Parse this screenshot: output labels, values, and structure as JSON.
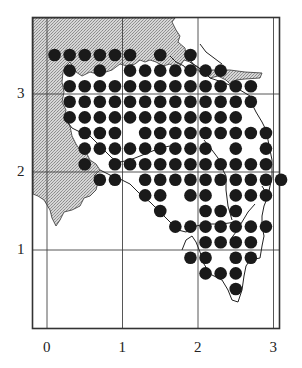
{
  "chart_data": {
    "type": "scatter",
    "title": "",
    "xlabel": "",
    "ylabel": "",
    "x_ticks": [
      "0",
      "1",
      "2",
      "3"
    ],
    "y_ticks": [
      "1",
      "2",
      "3"
    ],
    "xlim": [
      -0.2,
      3.1
    ],
    "ylim": [
      -0.2,
      3.6
    ],
    "grid": true,
    "dot_spacing": 0.2,
    "rows": [
      {
        "y": 3.5,
        "x": [
          0.1,
          0.3,
          0.5,
          0.7,
          0.9,
          1.1,
          1.5,
          1.9
        ]
      },
      {
        "y": 3.3,
        "x": [
          0.3,
          0.7,
          1.1,
          1.3,
          1.5,
          1.7,
          1.9,
          2.1,
          2.3
        ]
      },
      {
        "y": 3.1,
        "x": [
          0.3,
          0.5,
          0.7,
          0.9,
          1.1,
          1.3,
          1.5,
          1.7,
          1.9,
          2.1,
          2.3,
          2.5,
          2.7
        ]
      },
      {
        "y": 2.9,
        "x": [
          0.3,
          0.5,
          0.7,
          0.9,
          1.1,
          1.3,
          1.5,
          1.7,
          1.9,
          2.1,
          2.3,
          2.5,
          2.7
        ]
      },
      {
        "y": 2.7,
        "x": [
          0.3,
          0.5,
          0.7,
          0.9,
          1.1,
          1.3,
          1.5,
          1.7,
          1.9,
          2.1,
          2.3,
          2.5
        ]
      },
      {
        "y": 2.5,
        "x": [
          0.5,
          0.7,
          0.9,
          1.3,
          1.5,
          1.7,
          1.9,
          2.1,
          2.3,
          2.5,
          2.7,
          2.9
        ]
      },
      {
        "y": 2.3,
        "x": [
          0.5,
          0.7,
          0.9,
          1.1,
          1.3,
          1.5,
          1.7,
          1.9,
          2.1,
          2.5,
          2.9
        ]
      },
      {
        "y": 2.1,
        "x": [
          0.5,
          0.9,
          1.1,
          1.3,
          1.5,
          1.7,
          1.9,
          2.1,
          2.3,
          2.5,
          2.7,
          2.9
        ]
      },
      {
        "y": 1.9,
        "x": [
          0.7,
          0.9,
          1.3,
          1.5,
          1.7,
          1.9,
          2.1,
          2.3,
          2.5,
          2.7,
          2.9,
          3.1
        ]
      },
      {
        "y": 1.7,
        "x": [
          1.3,
          1.5,
          1.9,
          2.1,
          2.5,
          2.7,
          2.9
        ]
      },
      {
        "y": 1.5,
        "x": [
          1.5,
          2.1,
          2.3,
          2.5
        ]
      },
      {
        "y": 1.3,
        "x": [
          1.7,
          1.9,
          2.1,
          2.3,
          2.5,
          2.7,
          2.9
        ]
      },
      {
        "y": 1.1,
        "x": [
          2.1,
          2.3,
          2.5,
          2.7
        ]
      },
      {
        "y": 0.9,
        "x": [
          1.9,
          2.1,
          2.5,
          2.7
        ]
      },
      {
        "y": 0.7,
        "x": [
          2.1,
          2.3,
          2.5
        ]
      },
      {
        "y": 0.5,
        "x": [
          2.5
        ]
      }
    ]
  },
  "axes": {
    "x_labels": [
      {
        "text": "0",
        "value": 0
      },
      {
        "text": "1",
        "value": 1
      },
      {
        "text": "2",
        "value": 2
      },
      {
        "text": "3",
        "value": 3
      }
    ],
    "y_labels": [
      {
        "text": "1",
        "value": 1
      },
      {
        "text": "2",
        "value": 2
      },
      {
        "text": "3",
        "value": 3
      }
    ]
  },
  "style": {
    "dot_color": "#1a1a1a",
    "shade_color": "#c9c9c9",
    "frame_color": "#333333",
    "grid_color": "#444444",
    "coast_color": "#222222"
  }
}
